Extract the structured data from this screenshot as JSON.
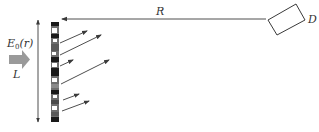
{
  "diagram": {
    "labels": {
      "distance": "R",
      "detector": "D",
      "field_main": "E",
      "field_sub": "0",
      "field_arg": "(r)",
      "length": "L"
    },
    "colors": {
      "line": "#3a3a3a",
      "incident_arrow": "#9a9a9a",
      "strip_dark": "#1a1a1a",
      "strip_mid": "#6e6e6e",
      "strip_light": "#ffffff",
      "background": "#ffffff"
    },
    "elements": [
      {
        "name": "incident-field-arrow",
        "label": "E0(r)",
        "direction": "right"
      },
      {
        "name": "length-dimension-arrow",
        "label": "L",
        "direction": "vertical double-headed"
      },
      {
        "name": "aperture-strip",
        "pattern": "black/white/gray squares"
      },
      {
        "name": "distance-arrow",
        "label": "R",
        "direction": "left, from detector to strip"
      },
      {
        "name": "detector",
        "label": "D",
        "shape": "tilted rectangle"
      },
      {
        "name": "scattered-rays",
        "count": 6,
        "direction": "up-right"
      }
    ]
  }
}
